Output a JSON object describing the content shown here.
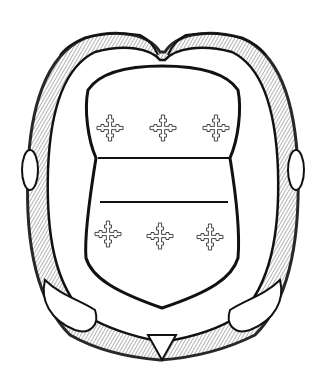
{
  "image": {
    "subject": "heraldic shield (escutcheon) within a twisted oval wreath",
    "style": "black and white line engraving",
    "colors": {
      "ink": "#111111",
      "paper": "#ffffff"
    },
    "shield": {
      "division": "fess (horizontal band across middle)",
      "charges_top": [
        "cross-crosslet",
        "cross-crosslet",
        "cross-crosslet"
      ],
      "charges_bottom": [
        "cross-crosslet",
        "cross-crosslet",
        "cross-crosslet"
      ]
    }
  }
}
